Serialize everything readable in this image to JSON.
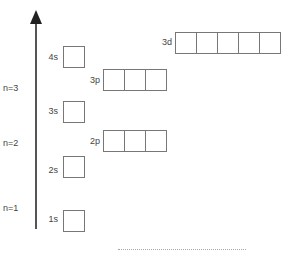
{
  "diagram": {
    "title": "",
    "axis": {
      "direction": "up",
      "label": "energy"
    },
    "shell_labels": [
      {
        "text": "n=3",
        "y": 88
      },
      {
        "text": "n=2",
        "y": 143
      },
      {
        "text": "n=1",
        "y": 207
      }
    ],
    "orbitals": [
      {
        "label": "1s",
        "boxes": 1
      },
      {
        "label": "2s",
        "boxes": 1
      },
      {
        "label": "2p",
        "boxes": 3
      },
      {
        "label": "3s",
        "boxes": 1
      },
      {
        "label": "3p",
        "boxes": 3
      },
      {
        "label": "4s",
        "boxes": 1
      },
      {
        "label": "3d",
        "boxes": 5
      }
    ],
    "colors": {
      "line": "#555555",
      "box_border": "#777777",
      "text": "#444444"
    }
  }
}
